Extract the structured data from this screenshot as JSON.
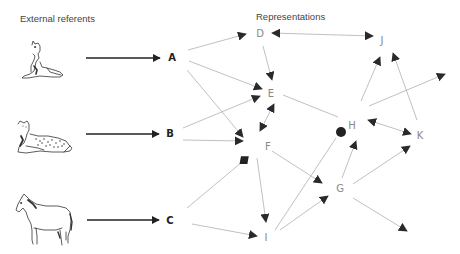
{
  "headings": {
    "external": "External referents",
    "representations": "Representations"
  },
  "referents": [
    {
      "name": "dog",
      "icon": "dog-icon",
      "target": "A"
    },
    {
      "name": "leopard",
      "icon": "leopard-icon",
      "target": "B"
    },
    {
      "name": "horse",
      "icon": "horse-icon",
      "target": "C"
    }
  ],
  "nodes": {
    "A": {
      "label": "A",
      "x": 172,
      "y": 61,
      "bold": true
    },
    "B": {
      "label": "B",
      "x": 170,
      "y": 136,
      "bold": true
    },
    "C": {
      "label": "C",
      "x": 170,
      "y": 223,
      "bold": true
    },
    "D": {
      "label": "D",
      "x": 260,
      "y": 37
    },
    "E": {
      "label": "E",
      "x": 271,
      "y": 97
    },
    "F": {
      "label": "F",
      "x": 268,
      "y": 150
    },
    "G": {
      "label": "G",
      "x": 340,
      "y": 192
    },
    "H": {
      "label": "H",
      "x": 352,
      "y": 129
    },
    "I": {
      "label": "I",
      "x": 266,
      "y": 241
    },
    "J": {
      "label": "J",
      "x": 382,
      "y": 44
    },
    "K": {
      "label": "K",
      "x": 420,
      "y": 139
    }
  },
  "edges": [
    {
      "from": "A",
      "to": "D",
      "type": "arrow"
    },
    {
      "from": "A",
      "to": "E",
      "type": "arrow"
    },
    {
      "from": "A",
      "to": "F",
      "type": "arrow"
    },
    {
      "from": "B",
      "to": "E",
      "type": "arrow"
    },
    {
      "from": "B",
      "to": "F",
      "type": "arrow"
    },
    {
      "from": "C",
      "to": "F",
      "type": "diamond"
    },
    {
      "from": "C",
      "to": "I",
      "type": "arrow"
    },
    {
      "from": "D",
      "to": "J",
      "type": "bidirectional"
    },
    {
      "from": "D",
      "to": "E",
      "type": "arrow"
    },
    {
      "from": "E",
      "to": "F",
      "type": "bidirectional"
    },
    {
      "from": "E",
      "to": "H",
      "type": "line"
    },
    {
      "from": "F",
      "to": "I",
      "type": "arrow"
    },
    {
      "from": "F",
      "to": "G",
      "type": "arrow"
    },
    {
      "from": "I",
      "to": "dot",
      "type": "dot"
    },
    {
      "from": "I",
      "to": "G",
      "type": "arrow"
    },
    {
      "from": "G",
      "to": "H",
      "type": "arrow"
    },
    {
      "from": "G",
      "to": "K",
      "type": "arrow"
    },
    {
      "from": "G",
      "to": "out-se",
      "type": "arrow"
    },
    {
      "from": "H",
      "to": "J",
      "type": "arrow"
    },
    {
      "from": "H",
      "to": "out-ne",
      "type": "arrow"
    },
    {
      "from": "H",
      "to": "K",
      "type": "bidirectional"
    },
    {
      "from": "K",
      "to": "J",
      "type": "arrow"
    }
  ],
  "colors": {
    "edge": "#b0b0b0",
    "arrowhead": "#2a2a2a",
    "label": "#777777",
    "bold_label": "#222222",
    "main_arrow": "#222222"
  }
}
